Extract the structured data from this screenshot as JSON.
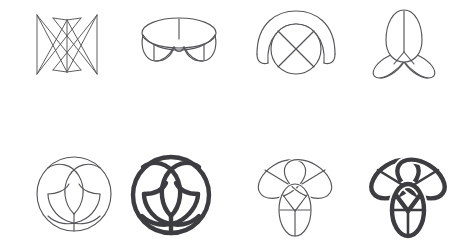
{
  "page": {
    "background_color": "#ffffff",
    "width": 463,
    "height": 252,
    "figure_count": 8,
    "rows": 2,
    "columns": 4
  },
  "style": {
    "thin_stroke_color": "#56565a",
    "bold_stroke_color": "#3d3d41",
    "thin_stroke_width": "1.15",
    "bold_stroke_width": "4.4",
    "mask_color": "#ffffff"
  },
  "figures": [
    {
      "id": "fig-1",
      "name": "edge-on-collapsed-wireframe",
      "row": 1,
      "column": 1,
      "style": "thin",
      "description": "Nearly edge-on view of the trefoil surface collapsed into crossing straight chords forming an M/W lattice",
      "x": 33,
      "y": 14,
      "width": 67,
      "height": 63
    },
    {
      "id": "fig-2",
      "name": "shallow-tilt-banded-ring",
      "row": 1,
      "column": 2,
      "style": "thin",
      "description": "Shallow tilt view: flattened elliptical band with three lower lobes and radial seams",
      "x": 141,
      "y": 17,
      "width": 75,
      "height": 56
    },
    {
      "id": "fig-3",
      "name": "tilted-disc-with-arch",
      "row": 1,
      "column": 3,
      "style": "thin",
      "description": "Tilted view: circular lobe with X seams overlapped by a broad rear arch lobe",
      "x": 256,
      "y": 11,
      "width": 78,
      "height": 66
    },
    {
      "id": "fig-4",
      "name": "side-tilt-three-petal",
      "row": 1,
      "column": 4,
      "style": "thin",
      "description": "Side tilt: one tall upright petal with two splayed lower petals crossing at center",
      "x": 373,
      "y": 11,
      "width": 60,
      "height": 67
    },
    {
      "id": "fig-5",
      "name": "face-on-trefoil-in-circle-thin",
      "row": 2,
      "column": 1,
      "style": "thin",
      "description": "Face-on view: trefoil knot pattern inscribed inside an outer circle, thin lines",
      "x": 36,
      "y": 156,
      "width": 76,
      "height": 76
    },
    {
      "id": "fig-6",
      "name": "face-on-trefoil-in-circle-bold",
      "row": 2,
      "column": 2,
      "style": "bold",
      "description": "Face-on view: same trefoil in circle rendered with thick dark strokes",
      "x": 130,
      "y": 155,
      "width": 80,
      "height": 80
    },
    {
      "id": "fig-7",
      "name": "three-lobed-trefoil-thin",
      "row": 2,
      "column": 3,
      "style": "thin",
      "description": "Three overlapping oval lobes forming a trefoil knot with interior seams, thin lines",
      "x": 256,
      "y": 158,
      "width": 78,
      "height": 76
    },
    {
      "id": "fig-8",
      "name": "three-lobed-trefoil-bold",
      "row": 2,
      "column": 4,
      "style": "bold",
      "description": "Three overlapping oval lobes forming a trefoil knot, thick dark strokes",
      "x": 367,
      "y": 157,
      "width": 80,
      "height": 78
    }
  ]
}
